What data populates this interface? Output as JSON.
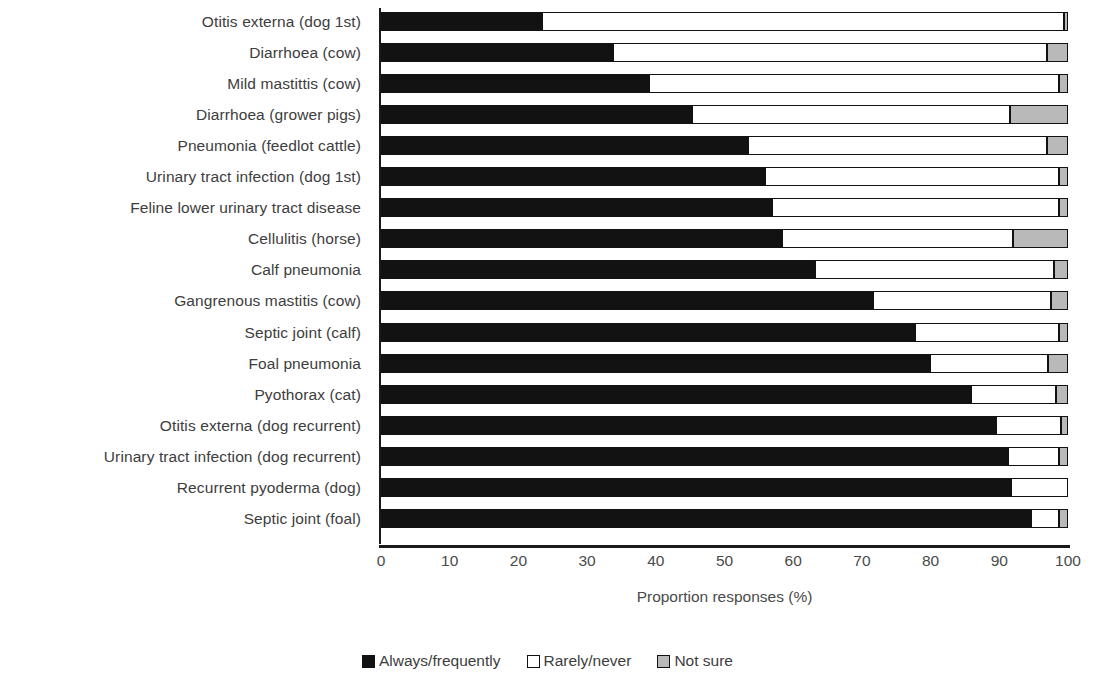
{
  "chart_data": {
    "type": "bar",
    "orientation": "horizontal",
    "stacked": true,
    "stack_mode": "percent",
    "title": "",
    "xlabel": "Proportion responses (%)",
    "ylabel": "",
    "xlim": [
      0,
      100
    ],
    "xticks": [
      0,
      10,
      20,
      30,
      40,
      50,
      60,
      70,
      80,
      90,
      100
    ],
    "grid": false,
    "legend_position": "bottom",
    "categories": [
      "Otitis externa (dog 1st)",
      "Diarrhoea (cow)",
      "Mild mastittis (cow)",
      "Diarrhoea (grower pigs)",
      "Pneumonia (feedlot cattle)",
      "Urinary tract infection (dog 1st)",
      "Feline lower urinary tract disease",
      "Cellulitis (horse)",
      "Calf pneumonia",
      "Gangrenous mastitis (cow)",
      "Septic joint (calf)",
      "Foal pneumonia",
      "Pyothorax (cat)",
      "Otitis externa (dog recurrent)",
      "Urinary tract infection (dog recurrent)",
      "Recurrent pyoderma (dog)",
      "Septic joint (foal)"
    ],
    "series": [
      {
        "name": "Always/frequently",
        "color": "#121212",
        "values": [
          23.5,
          33.8,
          39.0,
          45.2,
          53.4,
          55.9,
          56.9,
          58.4,
          63.2,
          71.6,
          77.8,
          79.9,
          85.9,
          89.5,
          91.2,
          91.7,
          94.6
        ]
      },
      {
        "name": "Rarely/never",
        "color": "#ffffff",
        "values": [
          75.9,
          63.2,
          59.7,
          46.4,
          43.6,
          42.8,
          41.8,
          33.6,
          34.8,
          25.9,
          20.9,
          17.2,
          12.3,
          9.5,
          7.5,
          8.3,
          4.1
        ]
      },
      {
        "name": "Not sure",
        "color": "#b9b9b9",
        "values": [
          0.6,
          3.0,
          1.3,
          8.4,
          3.0,
          1.3,
          1.3,
          8.0,
          2.0,
          2.5,
          1.3,
          2.9,
          1.8,
          1.0,
          1.3,
          0.0,
          1.3
        ]
      }
    ]
  },
  "legend": {
    "items": [
      {
        "label": "Always/frequently",
        "swatch": "black-square-swatch"
      },
      {
        "label": "Rarely/never",
        "swatch": "white-square-swatch"
      },
      {
        "label": "Not sure",
        "swatch": "gray-square-swatch"
      }
    ]
  }
}
